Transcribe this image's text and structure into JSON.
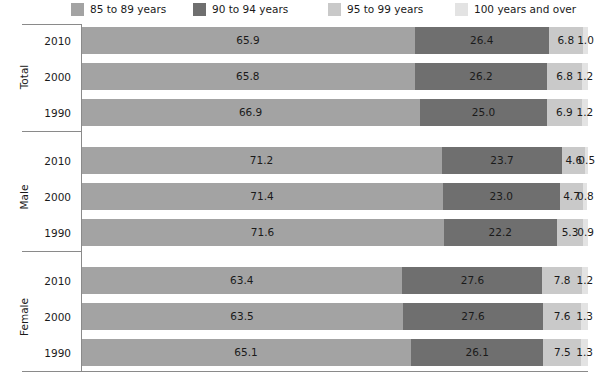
{
  "legend": {
    "items": [
      {
        "label": "85 to 89 years",
        "color": "#a3a3a3",
        "icon": "legend-swatch-icon"
      },
      {
        "label": "90 to 94 years",
        "color": "#6f6f6f",
        "icon": "legend-swatch-icon"
      },
      {
        "label": "95 to 99 years",
        "color": "#c9c9c9",
        "icon": "legend-swatch-icon"
      },
      {
        "label": "100 years and over",
        "color": "#e3e3e3",
        "icon": "legend-swatch-icon"
      }
    ]
  },
  "groups": [
    {
      "name": "Total",
      "rows": [
        {
          "year": "2010",
          "values": [
            65.9,
            26.4,
            6.8,
            1.0
          ]
        },
        {
          "year": "2000",
          "values": [
            65.8,
            26.2,
            6.8,
            1.2
          ]
        },
        {
          "year": "1990",
          "values": [
            66.9,
            25.0,
            6.9,
            1.2
          ]
        }
      ]
    },
    {
      "name": "Male",
      "rows": [
        {
          "year": "2010",
          "values": [
            71.2,
            23.7,
            4.6,
            0.5
          ]
        },
        {
          "year": "2000",
          "values": [
            71.4,
            23.0,
            4.7,
            0.8
          ]
        },
        {
          "year": "1990",
          "values": [
            71.6,
            22.2,
            5.3,
            0.9
          ]
        }
      ]
    },
    {
      "name": "Female",
      "rows": [
        {
          "year": "2010",
          "values": [
            63.4,
            27.6,
            7.8,
            1.2
          ]
        },
        {
          "year": "2000",
          "values": [
            63.5,
            27.6,
            7.6,
            1.3
          ]
        },
        {
          "year": "1990",
          "values": [
            65.1,
            26.1,
            7.5,
            1.3
          ]
        }
      ]
    }
  ],
  "chart_data": {
    "type": "bar",
    "orientation": "horizontal",
    "stacked": true,
    "stack_total": 100,
    "title": "",
    "subtitle": "",
    "xlabel": "",
    "ylabel": "",
    "xlim": [
      0,
      100
    ],
    "grid": false,
    "legend_position": "top",
    "group_labels": [
      "Total",
      "Male",
      "Female"
    ],
    "categories": [
      "Total 2010",
      "Total 2000",
      "Total 1990",
      "Male 2010",
      "Male 2000",
      "Male 1990",
      "Female 2010",
      "Female 2000",
      "Female 1990"
    ],
    "series": [
      {
        "name": "85 to 89 years",
        "color": "#a3a3a3",
        "values": [
          65.9,
          65.8,
          66.9,
          71.2,
          71.4,
          71.6,
          63.4,
          63.5,
          65.1
        ]
      },
      {
        "name": "90 to 94 years",
        "color": "#6f6f6f",
        "values": [
          26.4,
          26.2,
          25.0,
          23.7,
          23.0,
          22.2,
          27.6,
          27.6,
          26.1
        ]
      },
      {
        "name": "95 to 99 years",
        "color": "#c9c9c9",
        "values": [
          6.8,
          6.8,
          6.9,
          4.6,
          4.7,
          5.3,
          7.8,
          7.6,
          7.5
        ]
      },
      {
        "name": "100 years and over",
        "color": "#e3e3e3",
        "values": [
          1.0,
          1.2,
          1.2,
          0.5,
          0.8,
          0.9,
          1.2,
          1.3,
          1.3
        ]
      }
    ],
    "data_labels": true
  }
}
